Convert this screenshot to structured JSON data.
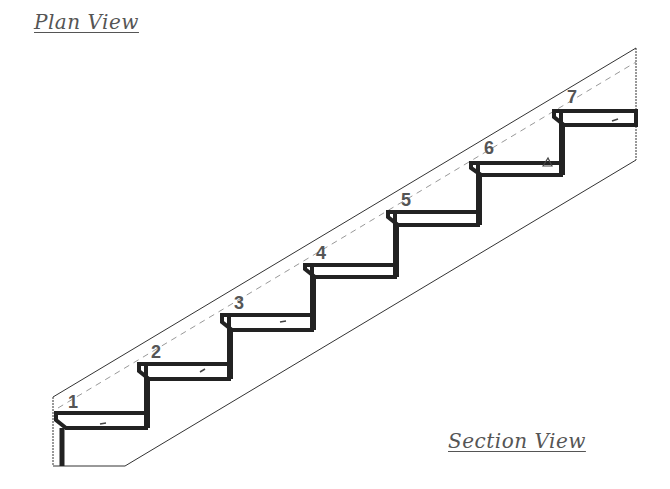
{
  "title_top": "Plan View",
  "title_bottom": "Section View",
  "diagram": {
    "type": "staircase-section",
    "step_count": 7,
    "steps": [
      {
        "label": "1",
        "x": 53,
        "y": 413
      },
      {
        "label": "2",
        "x": 136,
        "y": 364
      },
      {
        "label": "3",
        "x": 219,
        "y": 315
      },
      {
        "label": "4",
        "x": 302,
        "y": 265
      },
      {
        "label": "5",
        "x": 385,
        "y": 212
      },
      {
        "label": "6",
        "x": 468,
        "y": 163
      },
      {
        "label": "7",
        "x": 551,
        "y": 111
      }
    ],
    "line_color": "#222222",
    "guide_color": "#999999",
    "label_color": "#555555"
  }
}
